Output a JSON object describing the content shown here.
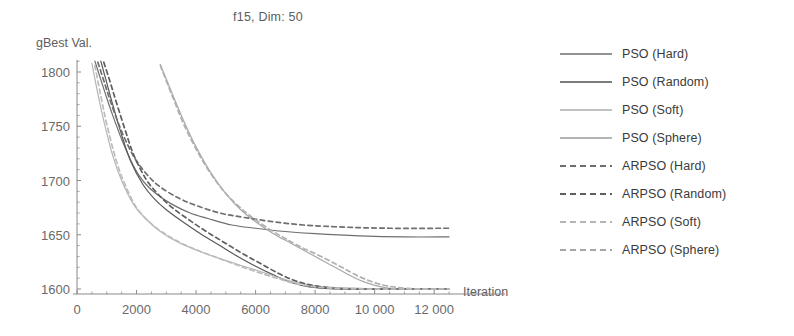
{
  "chart_data": {
    "type": "line",
    "title": "f15, Dim: 50",
    "xlabel": "Iteration",
    "ylabel": "gBest Val.",
    "xlim": [
      0,
      12800
    ],
    "ylim": [
      1592,
      1812
    ],
    "xticks": [
      0,
      2000,
      4000,
      6000,
      8000,
      10000,
      12000
    ],
    "xticklabels": [
      "0",
      "2000",
      "4000",
      "6000",
      "8000",
      "10 000",
      "12 000"
    ],
    "yticks": [
      1600,
      1650,
      1700,
      1750,
      1800
    ],
    "yticklabels": [
      "1600",
      "1650",
      "1700",
      "1750",
      "1800"
    ],
    "grid": false,
    "legend_position": "right",
    "series": [
      {
        "name": "PSO (Hard)",
        "style": "solid",
        "color": "#6e6e6e",
        "final_value": 1648,
        "x": [
          600,
          800,
          1000,
          1200,
          1500,
          1800,
          2100,
          2400,
          2800,
          3200,
          3800,
          4400,
          5200,
          6000,
          7000,
          8000,
          9500,
          11000,
          12500
        ],
        "y": [
          1810,
          1793,
          1776,
          1760,
          1738,
          1719,
          1704,
          1694,
          1685,
          1678,
          1670,
          1665,
          1659,
          1656,
          1653,
          1651,
          1649,
          1648,
          1648
        ]
      },
      {
        "name": "PSO (Random)",
        "style": "solid",
        "color": "#585858",
        "final_value": 1600,
        "x": [
          800,
          1000,
          1200,
          1500,
          1800,
          2200,
          2600,
          3000,
          3600,
          4200,
          4800,
          5400,
          6000,
          6600,
          7200,
          7800,
          8600,
          9600,
          11000,
          12500
        ],
        "y": [
          1810,
          1790,
          1770,
          1742,
          1718,
          1697,
          1683,
          1673,
          1661,
          1650,
          1640,
          1630,
          1621,
          1613,
          1606,
          1602,
          1600,
          1600,
          1600,
          1600
        ]
      },
      {
        "name": "PSO (Soft)",
        "style": "solid",
        "color": "#a8a8a8",
        "final_value": 1600,
        "x": [
          2800,
          3200,
          3600,
          4000,
          4500,
          5000,
          5500,
          6000,
          6600,
          7200,
          7800,
          8400,
          9000,
          9600,
          10400,
          11400,
          12500
        ],
        "y": [
          1807,
          1780,
          1754,
          1731,
          1707,
          1688,
          1673,
          1662,
          1651,
          1642,
          1633,
          1624,
          1615,
          1607,
          1601,
          1600,
          1600
        ]
      },
      {
        "name": "PSO (Sphere)",
        "style": "solid",
        "color": "#b5b5b5",
        "final_value": 1600,
        "x": [
          500,
          700,
          900,
          1200,
          1500,
          1900,
          2300,
          2800,
          3400,
          4000,
          4800,
          5600,
          6400,
          7200,
          8000,
          9000,
          10500,
          12500
        ],
        "y": [
          1808,
          1780,
          1755,
          1723,
          1700,
          1678,
          1665,
          1653,
          1643,
          1636,
          1628,
          1621,
          1614,
          1607,
          1603,
          1601,
          1600,
          1600
        ]
      },
      {
        "name": "ARPSO (Hard)",
        "style": "dashed",
        "color": "#6e6e6e",
        "final_value": 1656,
        "x": [
          700,
          900,
          1100,
          1400,
          1700,
          2000,
          2400,
          2800,
          3400,
          4000,
          4800,
          5600,
          6600,
          7600,
          9000,
          10500,
          12500
        ],
        "y": [
          1809,
          1792,
          1775,
          1752,
          1733,
          1718,
          1704,
          1694,
          1684,
          1677,
          1670,
          1666,
          1662,
          1659,
          1657,
          1656,
          1656
        ]
      },
      {
        "name": "ARPSO (Random)",
        "style": "dashed",
        "color": "#5e5e5e",
        "final_value": 1600,
        "x": [
          900,
          1100,
          1300,
          1600,
          1900,
          2300,
          2700,
          3200,
          3800,
          4400,
          5000,
          5600,
          6200,
          6800,
          7400,
          8200,
          9200,
          10600,
          12500
        ],
        "y": [
          1809,
          1792,
          1774,
          1748,
          1724,
          1702,
          1688,
          1675,
          1663,
          1652,
          1642,
          1632,
          1623,
          1614,
          1607,
          1602,
          1600,
          1600,
          1600
        ]
      },
      {
        "name": "ARPSO (Soft)",
        "style": "dashed",
        "color": "#b0b0b0",
        "final_value": 1600,
        "x": [
          2800,
          3200,
          3600,
          4100,
          4600,
          5100,
          5700,
          6300,
          6900,
          7500,
          8200,
          8900,
          9600,
          10400,
          11400,
          12500
        ],
        "y": [
          1806,
          1778,
          1751,
          1724,
          1702,
          1685,
          1670,
          1658,
          1648,
          1639,
          1630,
          1620,
          1610,
          1603,
          1600,
          1600
        ]
      },
      {
        "name": "ARPSO (Sphere)",
        "style": "dashed",
        "color": "#bcbcbc",
        "final_value": 1600,
        "x": [
          600,
          800,
          1000,
          1300,
          1600,
          2000,
          2500,
          3000,
          3600,
          4300,
          5100,
          5900,
          6700,
          7500,
          8400,
          9600,
          11000,
          12500
        ],
        "y": [
          1806,
          1778,
          1752,
          1720,
          1697,
          1675,
          1660,
          1650,
          1641,
          1633,
          1625,
          1617,
          1610,
          1604,
          1601,
          1600,
          1600,
          1600
        ]
      }
    ]
  },
  "legend": {
    "entries": [
      {
        "label": "PSO (Hard)",
        "style": "solid",
        "color": "#6e6e6e"
      },
      {
        "label": "PSO (Random)",
        "style": "solid",
        "color": "#505050"
      },
      {
        "label": "PSO (Soft)",
        "style": "solid",
        "color": "#adadad"
      },
      {
        "label": "PSO (Sphere)",
        "style": "solid",
        "color": "#9a9a9a"
      },
      {
        "label": "ARPSO (Hard)",
        "style": "dashed",
        "color": "#6e6e6e"
      },
      {
        "label": "ARPSO (Random)",
        "style": "dashed",
        "color": "#5e5e5e"
      },
      {
        "label": "ARPSO (Soft)",
        "style": "dashed",
        "color": "#b4b4b4"
      },
      {
        "label": "ARPSO (Sphere)",
        "style": "dashed",
        "color": "#a6a6a6"
      }
    ]
  },
  "axis": {
    "color": "#8a8a8a",
    "tick_color": "#6a6a6a"
  }
}
